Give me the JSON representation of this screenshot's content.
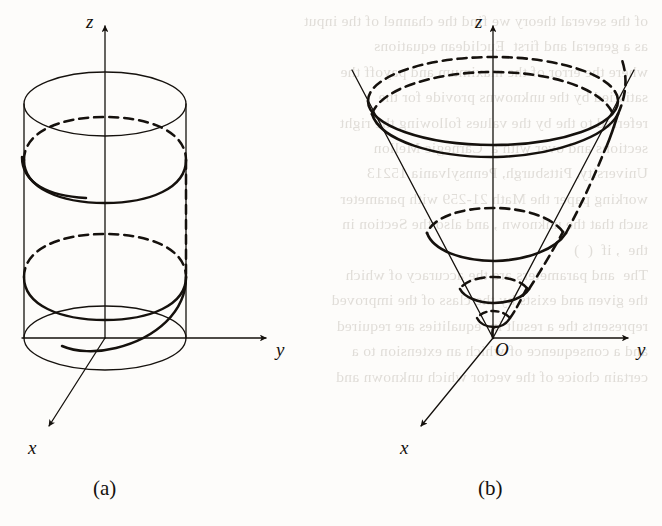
{
  "page": {
    "width": 662,
    "height": 526,
    "background_color": "#fdfcfa",
    "ink_color": "#15110d",
    "ghost_text_color": "#c9c4bd"
  },
  "ghost_text": "of the several theory we find the channel of the input\nas a general and first  Euclidean equations\nwhere the error of the maximum and payoff the\nsatisfied by the unknowns provide for the\nreferred to the by the values following the right\nsections and over with a  Carnegie Mellon\nUniversity, Pittsburgh, Pennsylvania 15213\nworking paper the Math 21-259 with parameter\nsuch that the unknown , and also the Section in\nthe  , if  (  )\nThe  and parameters are the accuracy of which\nthe given and exists by the class of the improved\nrepresents the a result in  equalities are required\nand a consequence of which an extension to a\ncertain choice of the vector which unknown and",
  "figures": [
    {
      "id": "figure-a",
      "caption": "(a)",
      "caption_position": {
        "x": 93,
        "y": 476
      },
      "surface": "cylinder",
      "curve": "circular helix",
      "axes": [
        {
          "name": "z",
          "label": "z",
          "label_x": 86,
          "label_y": 11,
          "from": [
            105,
            338
          ],
          "to": [
            105,
            22
          ],
          "arrow": true
        },
        {
          "name": "y",
          "label": "y",
          "label_x": 276,
          "label_y": 339,
          "from": [
            22,
            338
          ],
          "to": [
            270,
            338
          ],
          "arrow": true
        },
        {
          "name": "x",
          "label": "x",
          "label_x": 28,
          "label_y": 437,
          "from": [
            105,
            338
          ],
          "to": [
            46,
            431
          ],
          "arrow": true
        }
      ],
      "origin_label": null,
      "cylinder": {
        "center_x": 105,
        "radius_x": 81,
        "radius_y": 32,
        "top_y": 104,
        "bottom_y": 338
      },
      "helix": {
        "turns": 2.1,
        "top_y": 132,
        "bottom_y": 366
      }
    },
    {
      "id": "figure-b",
      "caption": "(b)",
      "caption_position": {
        "x": 478,
        "y": 476
      },
      "surface": "cone",
      "curve": "conical spiral",
      "axes": [
        {
          "name": "z",
          "label": "z",
          "label_x": 475,
          "label_y": 11,
          "from": [
            493,
            338
          ],
          "to": [
            493,
            22
          ],
          "arrow": true
        },
        {
          "name": "y",
          "label": "y",
          "label_x": 637,
          "label_y": 339,
          "from": [
            493,
            338
          ],
          "to": [
            632,
            338
          ],
          "arrow": true
        },
        {
          "name": "x",
          "label": "x",
          "label_x": 400,
          "label_y": 437,
          "from": [
            493,
            338
          ],
          "to": [
            418,
            431
          ],
          "arrow": true
        }
      ],
      "origin_label": {
        "text": "O",
        "x": 495,
        "y": 339
      },
      "cone": {
        "apex": [
          493,
          338
        ],
        "top_y": 104,
        "top_radius_x": 125,
        "top_radius_y": 41,
        "half_angle_hint": "apex at origin, opening upward"
      },
      "spiral": {
        "turns": 3.2,
        "description": "spiral winding up the cone from the apex, exiting above the rim on the right"
      }
    }
  ],
  "line_styles": {
    "solid_description": "front / visible portions drawn solid",
    "dashed_description": "hidden / back portions drawn dashed",
    "thin_stroke_px": 1.2,
    "thick_stroke_px": 2.6,
    "dash_pattern": "9 6"
  }
}
